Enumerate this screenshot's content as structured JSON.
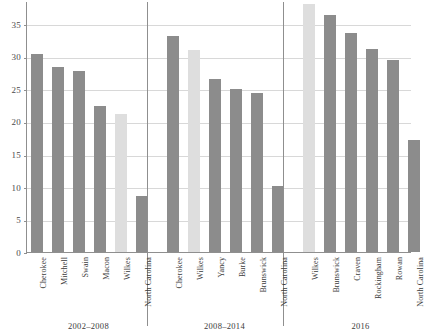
{
  "chart_data": {
    "type": "bar",
    "title": "",
    "subtitle": "",
    "xlabel": "",
    "ylabel": "",
    "ylim": [
      0,
      38.6
    ],
    "grid": true,
    "legend_position": "none",
    "yticks": [
      0,
      5,
      10,
      15,
      20,
      25,
      30,
      35
    ],
    "ytick_labels": [
      "0",
      "5",
      "10",
      "15",
      "20",
      "25",
      "30",
      "35"
    ],
    "groups": [
      {
        "label": "2002–2008",
        "categories": [
          "Cherokee",
          "Mitchell",
          "Swain",
          "Macon",
          "Wilkes",
          "North Carolina"
        ],
        "values": [
          30.5,
          28.5,
          27.9,
          22.4,
          21.2,
          8.6
        ],
        "highlight": [
          false,
          false,
          false,
          false,
          true,
          false
        ]
      },
      {
        "label": "2008–2014",
        "categories": [
          "Cherokee",
          "Wilkes",
          "Yancy",
          "Burke",
          "Brunswick",
          "North Carolina"
        ],
        "values": [
          33.2,
          31.0,
          26.6,
          25.1,
          24.5,
          10.2
        ],
        "highlight": [
          false,
          true,
          false,
          false,
          false,
          false
        ]
      },
      {
        "label": "2016",
        "categories": [
          "Wilkes",
          "Brunswick",
          "Craven",
          "Rockingham",
          "Rowan",
          "North Carolina"
        ],
        "values": [
          38.2,
          36.4,
          33.7,
          31.3,
          29.5,
          17.2
        ],
        "highlight": [
          true,
          false,
          false,
          false,
          false,
          false
        ]
      }
    ],
    "colors": {
      "bar_default": "#8c8c8c",
      "bar_highlight": "#dedede",
      "gridline": "#d8d8d8",
      "axis": "#8f8f8f",
      "text": "#3b3b3b"
    }
  }
}
